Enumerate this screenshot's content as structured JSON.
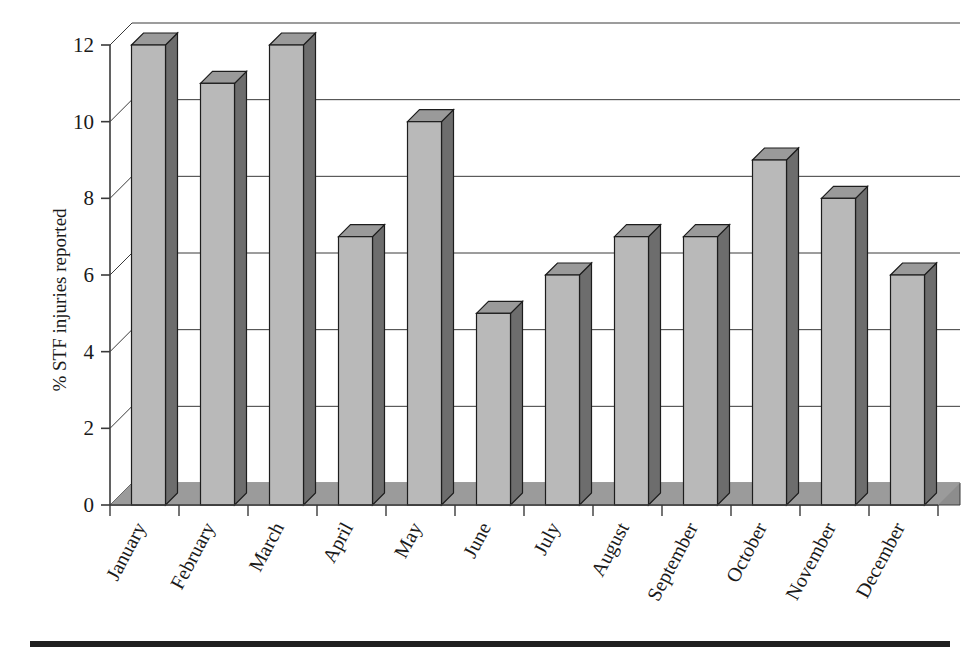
{
  "chart_data": {
    "type": "bar",
    "title": "",
    "subtitle": "",
    "xlabel": "",
    "ylabel": "% STF injuries reported",
    "categories": [
      "January",
      "February",
      "March",
      "April",
      "May",
      "June",
      "July",
      "August",
      "September",
      "October",
      "November",
      "December"
    ],
    "values": [
      12,
      11,
      12,
      7,
      10,
      5,
      6,
      7,
      7,
      9,
      8,
      6
    ],
    "series": [
      {
        "name": "% STF injuries reported",
        "values": [
          12,
          11,
          12,
          7,
          10,
          5,
          6,
          7,
          7,
          9,
          8,
          6
        ]
      }
    ],
    "ylim": [
      0,
      12
    ],
    "yticks": [
      0,
      2,
      4,
      6,
      8,
      10,
      12
    ],
    "ytick_labels": [
      "0",
      "2",
      "4",
      "6",
      "8",
      "10",
      "12"
    ],
    "grid": true,
    "gridlines_axis": "y",
    "legend": false,
    "legend_position": "none",
    "style": "3d-column",
    "annotations": [],
    "colors": {
      "bar_front": "#b9b9b9",
      "bar_side": "#6d6d6d",
      "bar_top": "#9a9a9a",
      "bar_outline": "#1d1d1d",
      "floor": "#8d8d8d",
      "floor_top": "#a3a3a3",
      "gridline": "#3a3a3a",
      "axis": "#3a3a3a",
      "text": "#1a1a1a",
      "rule": "#202020",
      "background": "#ffffff"
    }
  },
  "figure": {
    "bottom_rule": true
  }
}
